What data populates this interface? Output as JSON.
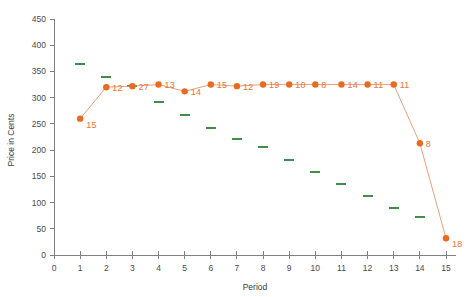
{
  "chart_data": {
    "type": "line",
    "title": "",
    "xlabel": "Period",
    "ylabel": "Price in Cents",
    "xlim": [
      0,
      15
    ],
    "ylim": [
      0,
      450
    ],
    "grid": false,
    "legend": "none",
    "x_ticks": [
      "0",
      "1",
      "2",
      "3",
      "4",
      "5",
      "6",
      "7",
      "8",
      "9",
      "10",
      "11",
      "12",
      "13",
      "14",
      "15"
    ],
    "y_ticks": [
      "0",
      "50",
      "100",
      "150",
      "200",
      "250",
      "300",
      "350",
      "400",
      "450"
    ],
    "series": [
      {
        "name": "Price",
        "marker": "circle",
        "color": "#ea6a20",
        "line_color": "#e8956b",
        "x": [
          1,
          2,
          3,
          4,
          5,
          6,
          7,
          8,
          9,
          10,
          11,
          12,
          13,
          14,
          15
        ],
        "values": [
          260,
          320,
          322,
          325,
          312,
          325,
          322,
          325,
          325,
          325,
          325,
          325,
          325,
          213,
          32
        ],
        "point_labels": [
          "15",
          "12",
          "27",
          "13",
          "14",
          "15",
          "12",
          "19",
          "10",
          "8",
          "14",
          "11",
          "11",
          "8",
          "18"
        ]
      },
      {
        "name": "Reference",
        "marker": "dash",
        "color": "#3f8f49",
        "x": [
          1,
          2,
          3,
          4,
          5,
          6,
          7,
          8,
          9,
          10,
          11,
          12,
          13,
          14
        ],
        "values": [
          364,
          340,
          322,
          291,
          267,
          243,
          222,
          205,
          182,
          158,
          135,
          112,
          90,
          72
        ]
      }
    ]
  }
}
